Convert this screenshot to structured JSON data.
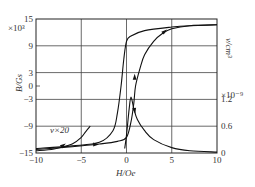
{
  "chart_data": {
    "type": "line",
    "title": "",
    "xlabel": "H/Oe",
    "ylabel": "B/Gs",
    "ylabel_multiplier": "×10³",
    "y2label": "v/cm³",
    "y2label_multiplier": "×10⁻⁹",
    "xlim": [
      -10,
      10
    ],
    "ylim": [
      -15,
      15
    ],
    "y2lim": [
      0,
      1.2
    ],
    "grid": true,
    "x_ticks": [
      "-10",
      "-5",
      "0",
      "5",
      "10"
    ],
    "y_ticks": [
      "15",
      "9",
      "3",
      "0",
      "-3",
      "-9",
      "-15"
    ],
    "y2_ticks": [
      "1.2",
      "0.6",
      "0"
    ],
    "annotation": "v×20",
    "series": [
      {
        "name": "B ascending branch",
        "axis": "left",
        "x": [
          -10,
          -6,
          -3,
          -1,
          0,
          0.5,
          0.8,
          1,
          1.5,
          2,
          3,
          4,
          5,
          7,
          10
        ],
        "y": [
          -14.2,
          -13.6,
          -13,
          -12.4,
          -11.5,
          -8,
          -4,
          0,
          4,
          7,
          10,
          11.8,
          12.8,
          13.5,
          13.7
        ]
      },
      {
        "name": "B descending branch",
        "axis": "left",
        "x": [
          10,
          7,
          5,
          2,
          0.5,
          0,
          -0.3,
          -0.6,
          -1,
          -1.5,
          -3,
          -6,
          -10
        ],
        "y": [
          13.7,
          13.5,
          13.2,
          12.4,
          11.2,
          10,
          6,
          0,
          -6,
          -10,
          -12.6,
          -13.4,
          -14
        ]
      },
      {
        "name": "v×20 (left)",
        "axis": "right",
        "x": [
          -10,
          -8,
          -6,
          -5,
          -4.5,
          -4
        ],
        "y": [
          0.05,
          0.09,
          0.2,
          0.35,
          0.48,
          0.6
        ]
      },
      {
        "name": "v",
        "axis": "right",
        "x": [
          -0.2,
          0,
          0.3,
          0.5,
          0.8,
          1.2,
          2,
          3,
          5,
          7,
          10
        ],
        "y": [
          0.1,
          0.4,
          1.0,
          1.25,
          1.0,
          0.75,
          0.5,
          0.3,
          0.12,
          0.05,
          0.02
        ]
      }
    ]
  },
  "labels": {
    "y_mult": "×10³",
    "y_label": "B/Gs",
    "y2_label": "v/cm³",
    "y2_mult": "×10⁻⁹",
    "x_label": "H/Oe",
    "annotation": "v×20"
  }
}
